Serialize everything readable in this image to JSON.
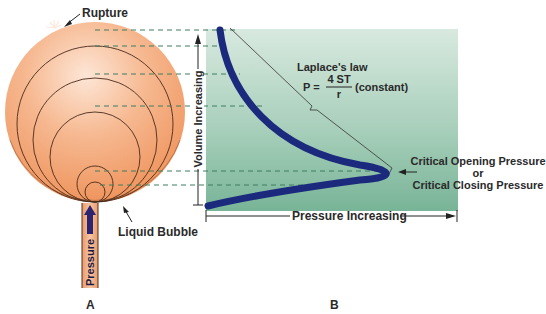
{
  "figure": {
    "panel_a": {
      "letter": "A",
      "labels": {
        "rupture": "Rupture",
        "liquid_bubble": "Liquid Bubble",
        "pressure": "Pressure"
      }
    },
    "panel_b": {
      "letter": "B",
      "axis": {
        "y_label": "Volume Increasing",
        "x_label": "Pressure Increasing"
      },
      "law": {
        "title": "Laplace's law",
        "lhs": "P =",
        "numerator": "4 ST",
        "denominator": "r",
        "suffix": "(constant)"
      },
      "annotation": {
        "line1": "Critical Opening Pressure",
        "line2": "or",
        "line3": "Critical Closing Pressure"
      }
    },
    "colors": {
      "bubble": "#f1a070",
      "bubble_highlight": "#fde3d3",
      "panel_bg_top": "#d6e8de",
      "panel_bg_bottom": "#7fb99d",
      "curve": "#1b2a7d",
      "dashed": "#3a7a5e",
      "text": "#2a2a2a"
    }
  }
}
